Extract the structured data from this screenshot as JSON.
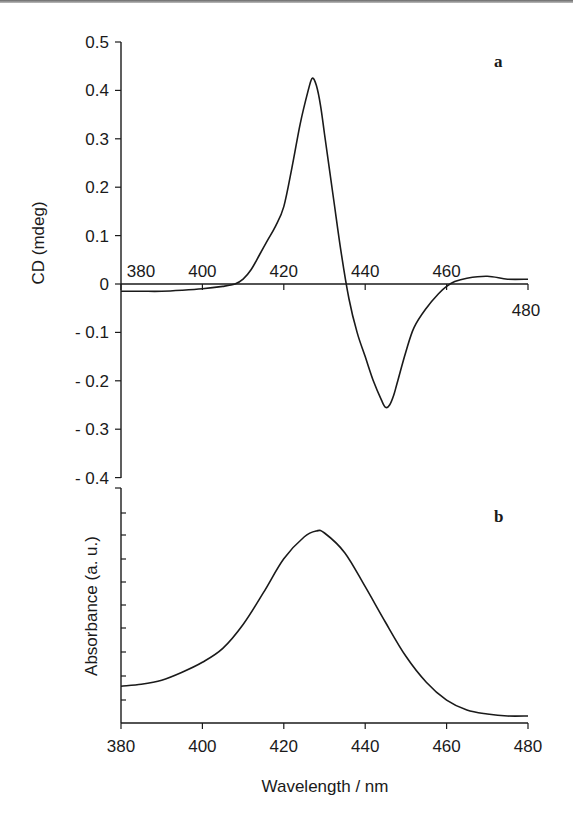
{
  "figure": {
    "x_axis_title": "Wavelength / nm",
    "panel_a": {
      "label": "a",
      "y_axis_title": "CD  (mdeg)",
      "y_tick_labels": [
        "0.5",
        "0.4",
        "0.3",
        "0.2",
        "0.1",
        "0",
        "- 0.1",
        "- 0.2",
        "- 0.3",
        "- 0.4"
      ],
      "x_tick_labels_on_zero_line": [
        "380",
        "400",
        "420",
        "440",
        "460",
        "480"
      ]
    },
    "panel_b": {
      "label": "b",
      "y_axis_title": "Absorbance  (a. u.)",
      "x_tick_labels": [
        "380",
        "400",
        "420",
        "440",
        "460",
        "480"
      ]
    }
  },
  "chart_data": [
    {
      "type": "line",
      "title": "a",
      "xlabel": "Wavelength / nm",
      "ylabel": "CD (mdeg)",
      "xlim": [
        380,
        480
      ],
      "ylim": [
        -0.4,
        0.5
      ],
      "x_ticks": [
        380,
        400,
        420,
        440,
        460,
        480
      ],
      "y_ticks": [
        0.5,
        0.4,
        0.3,
        0.2,
        0.1,
        0,
        -0.1,
        -0.2,
        -0.3,
        -0.4
      ],
      "grid": false,
      "legend": null,
      "series": [
        {
          "name": "CD spectrum",
          "x": [
            380,
            385,
            390,
            395,
            400,
            405,
            408,
            410,
            412,
            414,
            416,
            418,
            420,
            422,
            424,
            426,
            427,
            428,
            429,
            430,
            432,
            434,
            436,
            438,
            440,
            442,
            444,
            445,
            446,
            447,
            448,
            450,
            452,
            455,
            458,
            460,
            462,
            465,
            470,
            475,
            480
          ],
          "y": [
            -0.015,
            -0.015,
            -0.015,
            -0.013,
            -0.01,
            -0.005,
            0.0,
            0.01,
            0.03,
            0.06,
            0.09,
            0.12,
            0.16,
            0.24,
            0.33,
            0.4,
            0.425,
            0.41,
            0.37,
            0.31,
            0.19,
            0.07,
            -0.03,
            -0.1,
            -0.15,
            -0.2,
            -0.24,
            -0.255,
            -0.25,
            -0.23,
            -0.2,
            -0.14,
            -0.09,
            -0.05,
            -0.02,
            -0.005,
            0.005,
            0.012,
            0.016,
            0.01,
            0.01
          ]
        }
      ]
    },
    {
      "type": "line",
      "title": "b",
      "xlabel": "Wavelength / nm",
      "ylabel": "Absorbance (a. u.)",
      "xlim": [
        380,
        480
      ],
      "ylim": [
        0,
        1
      ],
      "x_ticks": [
        380,
        400,
        420,
        440,
        460,
        480
      ],
      "y_ticks": "unlabeled (9 minor ticks)",
      "grid": false,
      "legend": null,
      "series": [
        {
          "name": "Absorbance spectrum",
          "x": [
            380,
            385,
            390,
            395,
            400,
            405,
            410,
            415,
            420,
            425,
            428,
            430,
            435,
            440,
            445,
            450,
            455,
            460,
            465,
            470,
            475,
            480
          ],
          "y": [
            0.18,
            0.19,
            0.21,
            0.25,
            0.3,
            0.37,
            0.49,
            0.65,
            0.82,
            0.93,
            0.96,
            0.95,
            0.85,
            0.68,
            0.5,
            0.33,
            0.2,
            0.11,
            0.06,
            0.04,
            0.03,
            0.03
          ]
        }
      ]
    }
  ]
}
